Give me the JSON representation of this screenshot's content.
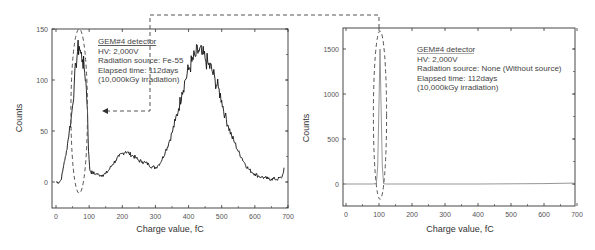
{
  "chart_data": [
    {
      "id": "left",
      "type": "line",
      "title": "",
      "xlabel": "Charge value, fC",
      "ylabel": "Counts",
      "xlim": [
        -10,
        700
      ],
      "ylim": [
        -25,
        150
      ],
      "xticks": [
        0,
        100,
        200,
        300,
        400,
        500,
        600,
        700
      ],
      "yticks": [
        0,
        50,
        100,
        150
      ],
      "grid": false,
      "line_color": "#111111",
      "annotation": {
        "lines": [
          "GEM#4 detector",
          "HV: 2,000V",
          "Radiation source: Fe-55",
          "Elapsed time: 112days",
          "(10,000kGy irradiation)"
        ]
      },
      "highlight_ellipse": {
        "cx": 70,
        "cy": 70,
        "x_radius": 25,
        "y_top": 150,
        "y_bottom": -11
      },
      "series": [
        {
          "name": "Fe-55 spectrum",
          "x": [
            0,
            10,
            15,
            20,
            25,
            30,
            35,
            40,
            45,
            50,
            55,
            60,
            65,
            70,
            75,
            80,
            85,
            90,
            95,
            98,
            100,
            102,
            105,
            110,
            120,
            130,
            140,
            150,
            160,
            170,
            180,
            190,
            200,
            210,
            220,
            230,
            240,
            250,
            260,
            270,
            280,
            290,
            300,
            310,
            320,
            330,
            340,
            350,
            360,
            370,
            380,
            390,
            400,
            410,
            420,
            430,
            440,
            450,
            460,
            470,
            480,
            490,
            500,
            510,
            520,
            530,
            540,
            550,
            560,
            570,
            580,
            590,
            600,
            610,
            620,
            630,
            640,
            650,
            660,
            670,
            680,
            685,
            688
          ],
          "y": [
            0,
            0,
            2,
            10,
            20,
            26,
            38,
            50,
            60,
            75,
            95,
            115,
            128,
            133,
            126,
            120,
            112,
            100,
            70,
            30,
            22,
            12,
            10,
            9,
            8,
            7,
            7,
            8,
            12,
            17,
            21,
            25,
            28,
            30,
            28,
            26,
            24,
            21,
            20,
            19,
            17,
            15,
            14,
            17,
            22,
            30,
            38,
            48,
            60,
            72,
            88,
            100,
            110,
            118,
            123,
            129,
            125,
            121,
            115,
            110,
            100,
            92,
            80,
            65,
            55,
            45,
            38,
            30,
            24,
            18,
            13,
            10,
            8,
            6,
            5,
            4,
            3,
            3,
            3,
            3,
            4,
            8,
            14
          ]
        }
      ]
    },
    {
      "id": "right",
      "type": "line",
      "title": "",
      "xlabel": "Charge value, fC",
      "ylabel": "Counts",
      "xlim": [
        -10,
        700
      ],
      "ylim": [
        -250,
        1750
      ],
      "xticks": [
        0,
        100,
        200,
        300,
        400,
        500,
        600,
        700
      ],
      "yticks": [
        0,
        500,
        1000,
        1500
      ],
      "grid": false,
      "line_color": "#8a8a8a",
      "annotation": {
        "lines": [
          "GEM#4 detector",
          "HV: 2,000V",
          "Radiation source: None (Without  source)",
          "Elapsed time: 112days",
          "(10,000kGy irradiation)"
        ]
      },
      "highlight_ellipse": {
        "cx": 103,
        "cy": 800,
        "x_radius": 20,
        "y_top": 1700,
        "y_bottom": -170
      },
      "series": [
        {
          "name": "No source (noise)",
          "x": [
            0,
            80,
            92,
            96,
            100,
            103,
            106,
            110,
            114,
            120,
            200,
            300,
            400,
            500,
            600,
            690
          ],
          "y": [
            0,
            0,
            5,
            200,
            900,
            1500,
            900,
            200,
            5,
            0,
            0,
            0,
            0,
            2,
            5,
            10
          ]
        }
      ]
    }
  ],
  "connector": {
    "description": "dashed connector from left annotation to right peak ellipse",
    "arrow": "left"
  },
  "colors": {
    "axis": "#333333",
    "dashed": "#555555",
    "left_line": "#111111",
    "right_line": "#8a8a8a"
  }
}
